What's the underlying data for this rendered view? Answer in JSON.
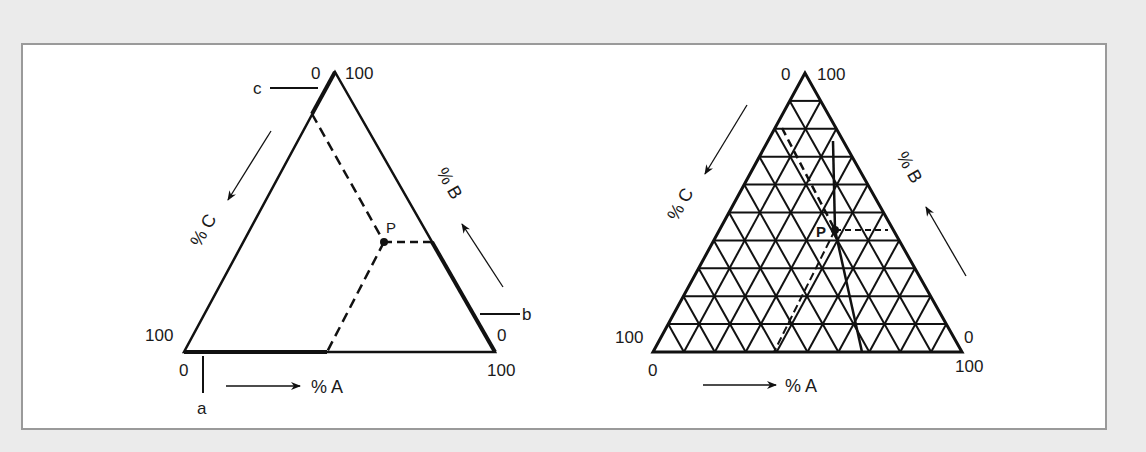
{
  "colors": {
    "background": "#ebebeb",
    "panel": "#ffffff",
    "panel_border": "#9a9a9a",
    "ink": "#111111"
  },
  "left_diagram": {
    "apex_labels": {
      "left": "0",
      "right": "100"
    },
    "left_corner_label": "100",
    "right_corner_label": "0",
    "base_left_label": "0",
    "base_right_label": "100",
    "axis_c": "% C",
    "axis_b": "% B",
    "axis_a": "% A",
    "marker_a": "a",
    "marker_b": "b",
    "marker_c": "c",
    "point": "P"
  },
  "right_diagram": {
    "apex_labels": {
      "left": "0",
      "right": "100"
    },
    "left_corner_label": "100",
    "right_corner_label": "0",
    "base_left_label": "0",
    "base_right_label": "100",
    "axis_c": "% C",
    "axis_b": "% B",
    "axis_a": "% A",
    "point": "P",
    "grid_divisions": 10
  }
}
